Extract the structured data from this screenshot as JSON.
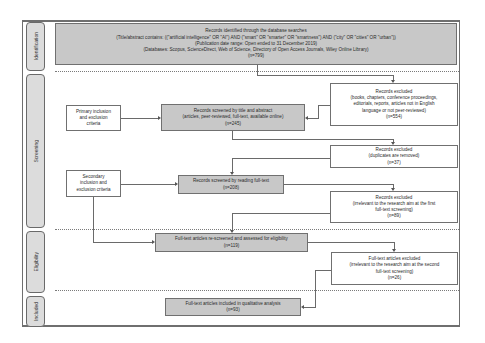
{
  "stages": [
    {
      "id": "identification",
      "label": "Identification"
    },
    {
      "id": "screening",
      "label": "Screening"
    },
    {
      "id": "eligibility",
      "label": "Eligibility"
    },
    {
      "id": "included",
      "label": "Included"
    }
  ],
  "identification_box": {
    "lines": [
      "Records identified through the database searches",
      "(Title/abstract contains: ((\"artificial intelligence\" OR \"AI\") AND (\"smart\" OR \"smarter\" OR \"smartness\") AND (\"city\" OR \"cities\" OR \"urban\"))",
      "(Publication date range: Open ended to 31 December 2019)",
      "(Databases: Scopus, ScienceDirect, Web of Science, Directory of Open Access Journals, Wiley Online Library)",
      "(n=799)"
    ]
  },
  "criteria": {
    "primary": {
      "lines": [
        "Primary inclusion",
        "and exclusion",
        "criteria"
      ]
    },
    "secondary": {
      "lines": [
        "Secondary",
        "inclusion and",
        "exclusion criteria"
      ]
    }
  },
  "flow": {
    "screened_title_abstract": {
      "lines": [
        "Records screened by title and abstract",
        "(articles, peer-reviewed, full-text, available online)",
        "(n=245)"
      ]
    },
    "screened_full_text": {
      "lines": [
        "Records screened by reading full-text",
        "(n=208)"
      ]
    },
    "rescreened_eligibility": {
      "lines": [
        "Full-text articles re-screened and assessed for eligibility",
        "(n=119)"
      ]
    },
    "included_qualitative": {
      "lines": [
        "Full-text articles included in qualitative analysis",
        "(n=93)"
      ]
    }
  },
  "exclusions": {
    "first": {
      "lines": [
        "Records excluded",
        "(books, chapters, conference proceedings,",
        "editorials, reports, articles not in English",
        "language or not peer-reviewed)",
        "(n=554)"
      ]
    },
    "duplicates": {
      "lines": [
        "Records excluded",
        "(duplicates are removed)",
        "(n=37)"
      ]
    },
    "first_fulltext": {
      "lines": [
        "Records excluded",
        "(irrelevant to the research aim at the first",
        "full-text screening)",
        "(n=89)"
      ]
    },
    "second_fulltext": {
      "lines": [
        "Full-text articles excluded",
        "(irrelevant to the research aim at the second",
        "full-text screening)",
        "(n=26)"
      ]
    }
  }
}
